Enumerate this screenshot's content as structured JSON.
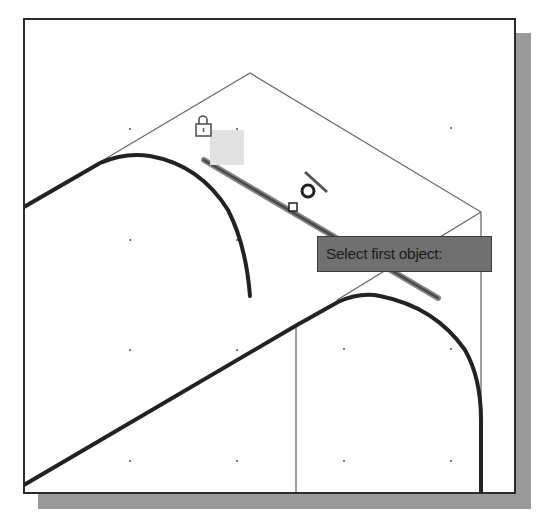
{
  "viewport": {
    "tooltip": "Select first object:",
    "cursor": {
      "pickbox": "pickbox-square",
      "snap_marker": "tangent-snap-marker"
    },
    "lock_badge_icon": "lock-icon",
    "colors": {
      "background": "#ffffff",
      "frame": "#2a2a2a",
      "shadow": "#9a9a9a",
      "thin_line": "#6a6a6a",
      "thick_line": "#222222",
      "highlight_line": "#777777",
      "tooltip_bg": "#707070",
      "tooltip_text": "#1c1c1c",
      "lock_badge_bg": "#e2e2e2"
    }
  }
}
